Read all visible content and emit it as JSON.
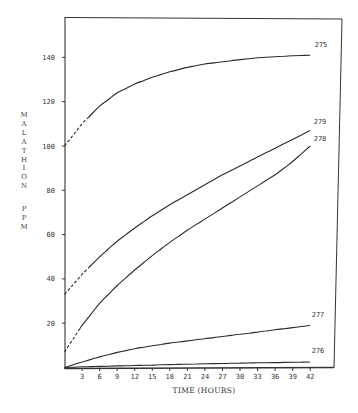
{
  "chart_data": {
    "type": "line",
    "title": "",
    "xlabel": "TIME (HOURS)",
    "ylabel": "MALATHION PPM",
    "xlim": [
      0,
      45
    ],
    "ylim": [
      0,
      158
    ],
    "grid": false,
    "legend": "inline labels at right end of each curve",
    "x_ticks": [
      3,
      6,
      9,
      12,
      15,
      18,
      21,
      24,
      27,
      30,
      33,
      36,
      39,
      42
    ],
    "y_ticks": [
      20,
      40,
      60,
      80,
      100,
      120,
      140
    ],
    "x": [
      0,
      3,
      6,
      9,
      12,
      15,
      18,
      21,
      24,
      27,
      30,
      33,
      36,
      39,
      42
    ],
    "series": [
      {
        "name": "275",
        "values": [
          100,
          110,
          118,
          124,
          128,
          131,
          133.5,
          135.5,
          137,
          138,
          139,
          139.8,
          140.3,
          140.7,
          141
        ],
        "dashed_until": 4
      },
      {
        "name": "279",
        "values": [
          33,
          42,
          50,
          57,
          63,
          68.5,
          73.5,
          78,
          82.5,
          87,
          91,
          95,
          99,
          103,
          107
        ],
        "dashed_until": 4.5
      },
      {
        "name": "278",
        "values": [
          7,
          19,
          29,
          37,
          44,
          50.5,
          56.5,
          62,
          67,
          72,
          77,
          82,
          87,
          93,
          100
        ],
        "dashed_until": 2.6
      },
      {
        "name": "277",
        "values": [
          0,
          2.5,
          4.8,
          6.8,
          8.5,
          9.8,
          11,
          12,
          13,
          14,
          15,
          16,
          17,
          18,
          19
        ]
      },
      {
        "name": "276",
        "values": [
          0,
          0.3,
          0.5,
          0.7,
          0.9,
          1.1,
          1.3,
          1.5,
          1.7,
          1.8,
          2,
          2.1,
          2.2,
          2.4,
          2.5
        ]
      }
    ]
  },
  "axes": {
    "xlabel": "TIME (HOURS)",
    "ylabel_word1": [
      "M",
      "A",
      "L",
      "A",
      "T",
      "H",
      "I",
      "O",
      "N"
    ],
    "ylabel_word2": [
      "P",
      "P",
      "M"
    ]
  },
  "colors": {
    "line": "#2a2a2a",
    "frame": "#333333",
    "background": "#ffffff"
  }
}
